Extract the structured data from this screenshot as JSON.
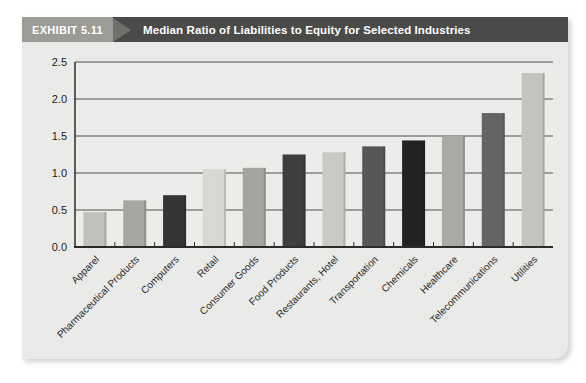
{
  "header": {
    "badge_label": "EXHIBIT 5.11",
    "title": "Median Ratio of Liabilities to Equity for Selected Industries",
    "colors": {
      "badge_bg": "#9b9b98",
      "arrow": "#6f6f6d",
      "bar_bg": "#4a4a48",
      "text": "#ffffff"
    }
  },
  "chart_data": {
    "type": "bar",
    "title": "Median Ratio of Liabilities to Equity for Selected Industries",
    "categories": [
      "Apparel",
      "Pharmaceutical Products",
      "Computers",
      "Retail",
      "Consumer Goods",
      "Food Products",
      "Restaurants, Hotel",
      "Transportation",
      "Chemicals",
      "Healthcare",
      "Telecommunications",
      "Utilities"
    ],
    "values": [
      0.47,
      0.63,
      0.7,
      1.05,
      1.07,
      1.25,
      1.28,
      1.36,
      1.44,
      1.5,
      1.81,
      2.35
    ],
    "bar_colors": [
      "#c0c0bd",
      "#a6a6a3",
      "#343432",
      "#d7d7d3",
      "#a4a4a1",
      "#3e3e3c",
      "#c9c9c5",
      "#575755",
      "#232321",
      "#a9a9a6",
      "#646462",
      "#c3c3c0"
    ],
    "xlabel": "",
    "ylabel": "",
    "ylim": [
      0,
      2.5
    ],
    "ytick_labels": [
      "0.0",
      "0.5",
      "1.0",
      "1.5",
      "2.0",
      "2.5"
    ],
    "grid": "horizontal",
    "legend": "none"
  },
  "panel_colors": {
    "panel_bg": "#eaeae8",
    "plot_bg": "#ececea",
    "gridline": "#4f4f4d",
    "axis": "#2b2b29",
    "tick_label": "#1c1c1c",
    "x_label": "#2a2a2a"
  }
}
